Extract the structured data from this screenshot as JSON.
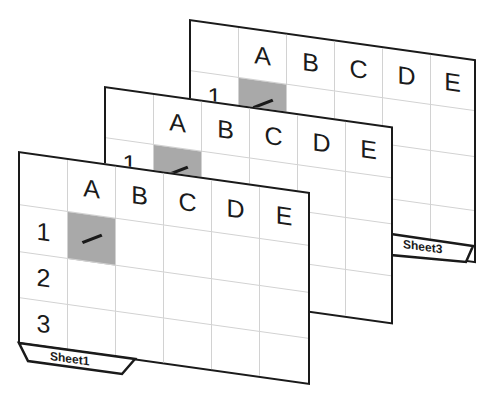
{
  "diagram": {
    "colors": {
      "border": "#1a1a1a",
      "gridline": "#d2d2d2",
      "selected_cell": "#a9a9a9",
      "background": "#ffffff"
    },
    "columns": [
      "A",
      "B",
      "C",
      "D",
      "E"
    ],
    "sheets": [
      {
        "name": "Sheet3",
        "rows": [
          "1",
          "",
          "",
          ""
        ],
        "selected_cell": "A1",
        "tab_label": "Sheet3"
      },
      {
        "name": "Sheet2",
        "rows": [
          "1",
          "",
          "",
          ""
        ],
        "selected_cell": "A1",
        "tab_label": ""
      },
      {
        "name": "Sheet1",
        "rows": [
          "1",
          "2",
          "3"
        ],
        "selected_cell": "A1",
        "tab_label": "Sheet1"
      }
    ]
  }
}
